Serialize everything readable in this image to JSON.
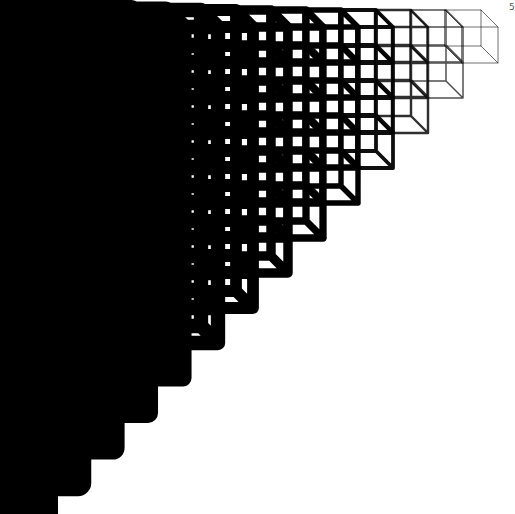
{
  "figure": {
    "background": "#ffffff",
    "stroke_color": "#000000",
    "columns": 14,
    "step_px": 35,
    "rightmost_column_right_edge": 498,
    "top_y": 10,
    "cube_face_size": 36,
    "depth_offset": 17,
    "stroke_min": 1,
    "stroke_max": 30,
    "corner_label": "5"
  }
}
